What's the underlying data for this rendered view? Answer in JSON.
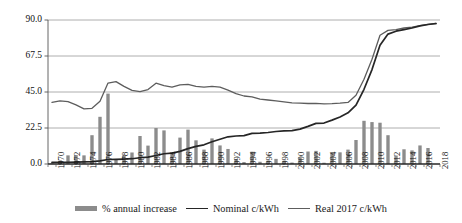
{
  "chart_data": {
    "type": "bar",
    "title": "",
    "xlabel": "",
    "ylabel": "",
    "ylim": [
      0,
      90
    ],
    "yticks": [
      "0.0",
      "22.5",
      "45.0",
      "67.5",
      "90.0"
    ],
    "ytick_values": [
      0,
      22.5,
      45,
      67.5,
      90
    ],
    "grid": true,
    "legend_position": "bottom",
    "x": [
      1970,
      1971,
      1972,
      1973,
      1974,
      1975,
      1976,
      1977,
      1978,
      1979,
      1980,
      1981,
      1982,
      1983,
      1984,
      1985,
      1986,
      1987,
      1988,
      1989,
      1990,
      1991,
      1992,
      1993,
      1994,
      1995,
      1996,
      1997,
      1998,
      1999,
      2000,
      2001,
      2002,
      2003,
      2004,
      2005,
      2006,
      2007,
      2008,
      2009,
      2010,
      2011,
      2012,
      2013,
      2014,
      2015,
      2016,
      2017,
      2018
    ],
    "xtick_labels": [
      "1970",
      "1972",
      "1974",
      "1976",
      "1978",
      "1980",
      "1982",
      "1984",
      "1986",
      "1988",
      "1990",
      "1992",
      "1994",
      "1996",
      "1998",
      "2000",
      "2002",
      "2004",
      "2006",
      "2008",
      "2010",
      "2012",
      "2014",
      "2016",
      "2018"
    ],
    "series": [
      {
        "name": "% annual increase",
        "type": "bar",
        "color": "#8c8c8c",
        "values": [
          0.4,
          2.2,
          5.4,
          5.6,
          5.4,
          18.0,
          29.5,
          44.0,
          3.1,
          5.5,
          7.2,
          17.5,
          11.5,
          22.5,
          21.0,
          6.7,
          16.5,
          21.5,
          14.8,
          9.0,
          16.0,
          11.6,
          9.4,
          3.0,
          1.2,
          7.7,
          1.4,
          2.1,
          3.2,
          2.0,
          0.9,
          4.0,
          7.8,
          8.2,
          0.8,
          6.9,
          7.3,
          9.0,
          15.0,
          27.0,
          26.2,
          25.8,
          18.0,
          5.3,
          9.2,
          8.5,
          11.6,
          10.0,
          null
        ]
      },
      {
        "name": "Nominal c/kWh",
        "type": "line",
        "color": "#262626",
        "values": [
          1.0,
          1.1,
          1.1,
          1.2,
          1.3,
          1.5,
          2.0,
          2.8,
          2.9,
          3.1,
          3.3,
          3.9,
          4.3,
          5.3,
          6.4,
          6.8,
          7.9,
          9.6,
          11.0,
          12.0,
          13.9,
          15.5,
          17.0,
          17.5,
          17.7,
          19.1,
          19.3,
          19.7,
          20.3,
          20.7,
          20.9,
          21.8,
          23.5,
          25.4,
          25.6,
          27.4,
          29.4,
          32.0,
          36.8,
          46.7,
          59.0,
          74.2,
          81.2,
          83.0,
          84.0,
          85.0,
          86.3,
          87.2,
          87.8
        ]
      },
      {
        "name": "Real 2017 c/kWh",
        "type": "line",
        "color": "#5d5d5d",
        "values": [
          38.5,
          39.5,
          39.0,
          37.0,
          34.5,
          34.8,
          39.2,
          50.6,
          51.5,
          48.5,
          46.0,
          45.2,
          46.5,
          50.5,
          49.0,
          48.0,
          49.5,
          49.8,
          48.5,
          48.0,
          48.5,
          48.0,
          46.2,
          44.0,
          42.5,
          42.0,
          40.5,
          40.0,
          39.5,
          38.8,
          38.2,
          38.0,
          37.8,
          37.9,
          37.6,
          37.7,
          38.0,
          38.5,
          43.0,
          53.0,
          65.5,
          80.5,
          83.5,
          84.0,
          85.0,
          85.5,
          86.5,
          87.3,
          87.8
        ]
      }
    ]
  },
  "legend": {
    "items": [
      {
        "label": "% annual increase",
        "marker": "bar-swatch",
        "color": "#8c8c8c"
      },
      {
        "label": "Nominal c/kWh",
        "marker": "line-swatch-dark",
        "color": "#262626"
      },
      {
        "label": "Real 2017 c/kWh",
        "marker": "line-swatch-gray",
        "color": "#5d5d5d"
      }
    ]
  }
}
